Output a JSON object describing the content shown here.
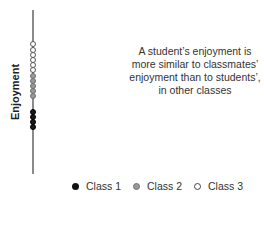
{
  "chart_data": {
    "type": "scatter",
    "title": "",
    "xlabel": "",
    "ylabel": "Enjoyment",
    "grid": false,
    "legend_position": "bottom",
    "axis": {
      "orientation": "vertical",
      "ticks": []
    },
    "annotation": "A student's enjoyment is more similar to classmates' enjoyment than to students', in other classes",
    "series": [
      {
        "name": "Class 1",
        "color": "#1a1a1a",
        "fill": "filled-black",
        "y_px": [
          112,
          117,
          122,
          127
        ]
      },
      {
        "name": "Class 2",
        "color": "#9a9a9a",
        "fill": "filled-gray",
        "y_px": [
          76,
          81,
          86,
          91,
          96
        ]
      },
      {
        "name": "Class 3",
        "color": "#ffffff",
        "fill": "hollow",
        "y_px": [
          44,
          50,
          55,
          60,
          65,
          70
        ]
      }
    ]
  },
  "ylabel": "Enjoyment",
  "annotation": "A student’s enjoyment is more similar to classmates’ enjoyment than to students’, in other classes",
  "legend": {
    "items": [
      {
        "label": "Class 1",
        "style": "c1"
      },
      {
        "label": "Class 2",
        "style": "c2"
      },
      {
        "label": "Class 3",
        "style": "c3"
      }
    ]
  }
}
